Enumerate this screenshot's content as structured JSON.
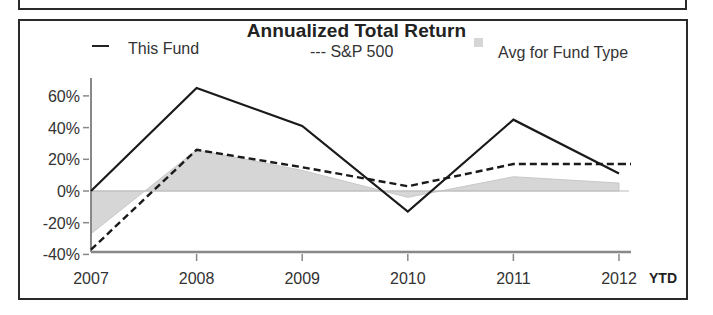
{
  "chart_data": {
    "type": "line",
    "title": "Annualized Total Return",
    "xlabel": "",
    "ylabel": "",
    "categories": [
      "2007",
      "2008",
      "2009",
      "2010",
      "2011",
      "2012"
    ],
    "x_suffix_label": "YTD",
    "ylim": [
      -40,
      70
    ],
    "yticks": [
      "60%",
      "40%",
      "20%",
      "0%",
      "-20%",
      "-40%"
    ],
    "ytick_values": [
      60,
      40,
      20,
      0,
      -20,
      -40
    ],
    "grid": false,
    "legend_position": "top",
    "series": [
      {
        "name": "This Fund",
        "style": "solid line",
        "values": [
          0,
          65,
          41,
          -13,
          45,
          11
        ]
      },
      {
        "name": "S&P 500",
        "style": "dashed line",
        "values": [
          -37,
          26,
          15,
          3,
          17,
          17
        ]
      },
      {
        "name": "Avg for Fund Type",
        "style": "shaded area",
        "values": [
          -27,
          26,
          13,
          -4,
          9,
          5
        ]
      }
    ]
  },
  "legend": {
    "fund": "This Fund",
    "sp500": "--- S&P 500",
    "avg": "Avg for Fund Type"
  },
  "colors": {
    "fund_line": "#1a1a1a",
    "sp500_line": "#1a1a1a",
    "avg_fill": "#d6d6d6",
    "axis": "#888888"
  }
}
